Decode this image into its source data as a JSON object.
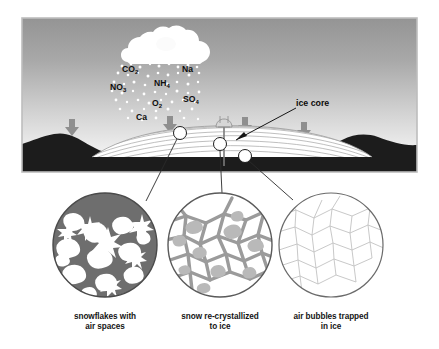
{
  "figure": {
    "frame": {
      "x": 22,
      "y": 18,
      "w": 395,
      "h": 154,
      "border_color": "#b9b9b9",
      "outer_bg": "#ffffff"
    },
    "sky": {
      "top_color": "#9d9d9d",
      "bottom_color": "#f2f2f2"
    },
    "bedrock_color": "#1c1c1c",
    "ice_color": "#ffffff",
    "ice_layer_line_color": "#9a9a9a",
    "arrow_color": "#8f8f8f",
    "leader_color": "#2a2a2a"
  },
  "sky_labels": {
    "ice_core": "ice core"
  },
  "chemicals": [
    {
      "id": "co2",
      "formula": "CO",
      "sub": "2",
      "x": 122,
      "y": 70
    },
    {
      "id": "na",
      "formula": "Na",
      "sub": "",
      "x": 182,
      "y": 70
    },
    {
      "id": "no3",
      "formula": "NO",
      "sub": "3",
      "x": 112,
      "y": 87
    },
    {
      "id": "nh4",
      "formula": "NH",
      "sub": "4",
      "x": 155,
      "y": 83
    },
    {
      "id": "so4",
      "formula": "SO",
      "sub": "4",
      "x": 184,
      "y": 99
    },
    {
      "id": "o2",
      "formula": "O",
      "sub": "2",
      "x": 152,
      "y": 103
    },
    {
      "id": "ca",
      "formula": "Ca",
      "sub": "",
      "x": 137,
      "y": 117
    }
  ],
  "deposition_arrows": [
    {
      "id": "arrow-1",
      "x": 72,
      "y": 119
    },
    {
      "id": "arrow-2",
      "x": 170,
      "y": 116
    },
    {
      "id": "arrow-3",
      "x": 245,
      "y": 117
    },
    {
      "id": "arrow-4",
      "x": 304,
      "y": 122
    }
  ],
  "sample_markers": [
    {
      "id": "marker-shallow",
      "x": 180,
      "y": 133,
      "r": 6.5
    },
    {
      "id": "marker-mid",
      "x": 220,
      "y": 144,
      "r": 6.5
    },
    {
      "id": "marker-deep",
      "x": 245,
      "y": 156,
      "r": 6.5
    }
  ],
  "detail_circles": [
    {
      "id": "snowflakes",
      "cx": 105,
      "cy": 245,
      "r": 52,
      "fill": "#6e6e6e",
      "caption_line1": "snowflakes with",
      "caption_line2": "air spaces"
    },
    {
      "id": "recrystallized",
      "cx": 220,
      "cy": 245,
      "r": 52,
      "fill": "#ffffff",
      "caption_line1": "snow re-crystallized",
      "caption_line2": "to ice"
    },
    {
      "id": "air-bubbles",
      "cx": 331,
      "cy": 245,
      "r": 52,
      "fill": "#ffffff",
      "caption_line1": "air bubbles trapped",
      "caption_line2": "in ice"
    }
  ]
}
